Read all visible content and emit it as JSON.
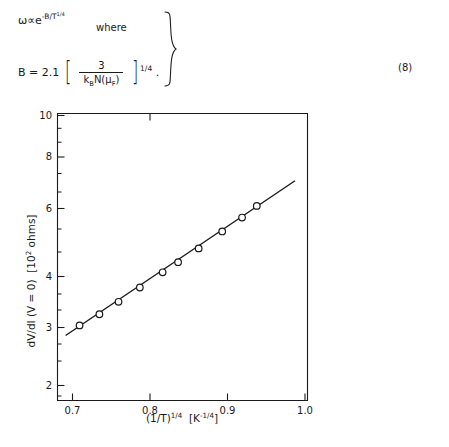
{
  "equation": {
    "line1_prefix": "ω∝e",
    "line1_exp_base": "-B/T",
    "line1_exp_sup": "1/4",
    "where_label": "where",
    "line2_lhs": "B = 2.1",
    "bracket_open": "[",
    "bracket_close": "]",
    "numerator": "3",
    "denominator_k": "k",
    "denominator_k_sub": "B",
    "denominator_rest": "N(μ",
    "denominator_rest_sub": "F",
    "denominator_tail": ")",
    "outer_exponent": "1/4",
    "period": ".",
    "brace": "}",
    "number": "(8)"
  },
  "chart_data": {
    "type": "scatter",
    "title": "",
    "xlabel": "(1/T)^(1/4)  [K^(-1/4)]",
    "ylabel": "dV/dI (V = 0)   [10^2 ohms]",
    "xlabel_parts": {
      "base": "(1/T)",
      "sup": "1/4",
      "unit_open": "[",
      "unit_base": "K",
      "unit_sup": "-1/4",
      "unit_close": "]"
    },
    "ylabel_parts": {
      "main": "dV/dI (V = 0)",
      "unit_open": "[",
      "unit_base": "10",
      "unit_sup": "2",
      "unit_tail": " ohms",
      "unit_close": "]"
    },
    "xscale": "linear",
    "yscale": "log",
    "xlim": [
      0.665,
      1.005
    ],
    "ylim": [
      1.75,
      10.4
    ],
    "xticks": [
      0.7,
      0.8,
      0.9,
      1.0
    ],
    "xtick_labels": [
      "0.7",
      "0.8",
      "0.9",
      "1.0"
    ],
    "yticks": [
      2,
      3,
      4,
      6,
      8,
      10
    ],
    "ytick_labels": [
      "2",
      "3",
      "4",
      "6",
      "8",
      "10"
    ],
    "yminor_ticks": [
      1.8,
      1.9,
      2.2,
      2.4,
      2.6,
      2.8,
      3.2,
      3.4,
      3.6,
      3.8,
      4.5,
      5,
      5.5,
      6.5,
      7,
      7.5,
      8.5,
      9,
      9.5
    ],
    "grid": false,
    "legend": null,
    "marker": "open-circle",
    "points": [
      {
        "x": 0.695,
        "y": 2.79
      },
      {
        "x": 0.722,
        "y": 2.99
      },
      {
        "x": 0.748,
        "y": 3.23
      },
      {
        "x": 0.777,
        "y": 3.53
      },
      {
        "x": 0.808,
        "y": 3.88
      },
      {
        "x": 0.829,
        "y": 4.13
      },
      {
        "x": 0.857,
        "y": 4.5
      },
      {
        "x": 0.889,
        "y": 5.0
      },
      {
        "x": 0.916,
        "y": 5.45
      },
      {
        "x": 0.936,
        "y": 5.86
      }
    ],
    "fit_line": {
      "x_start": 0.676,
      "y_start": 2.62,
      "x_end": 0.988,
      "y_end": 6.85
    }
  }
}
